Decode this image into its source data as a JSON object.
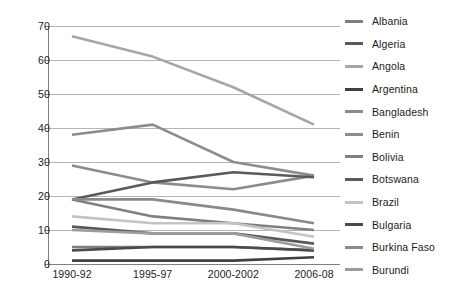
{
  "chart_data": {
    "type": "line",
    "title": "",
    "xlabel": "",
    "ylabel": "",
    "categories": [
      "1990-92",
      "1995-97",
      "2000-2002",
      "2006-08"
    ],
    "ylim": [
      0,
      70
    ],
    "yticks": [
      0,
      10,
      20,
      30,
      40,
      50,
      60,
      70
    ],
    "grid": true,
    "legend_position": "right",
    "series": [
      {
        "name": "Albania",
        "values": [
          5,
          5,
          5,
          4
        ],
        "color": "#7f7f7f"
      },
      {
        "name": "Algeria",
        "values": [
          11,
          9,
          9,
          6
        ],
        "color": "#595959"
      },
      {
        "name": "Angola",
        "values": [
          67,
          61,
          52,
          41
        ],
        "color": "#a6a6a6"
      },
      {
        "name": "Argentina",
        "values": [
          1,
          1,
          1,
          2
        ],
        "color": "#404040"
      },
      {
        "name": "Bangladesh",
        "values": [
          38,
          41,
          30,
          26
        ],
        "color": "#8c8c8c"
      },
      {
        "name": "Benin",
        "values": [
          29,
          24,
          22,
          26
        ],
        "color": "#8c8c8c"
      },
      {
        "name": "Bolivia",
        "values": [
          19,
          14,
          12,
          10
        ],
        "color": "#808080"
      },
      {
        "name": "Botswana",
        "values": [
          19,
          24,
          27,
          25.5
        ],
        "color": "#5a5a5a"
      },
      {
        "name": "Brazil",
        "values": [
          14,
          12,
          12,
          8
        ],
        "color": "#c4c4c4"
      },
      {
        "name": "Bulgaria",
        "values": [
          4,
          5,
          5,
          4
        ],
        "color": "#4a4a4a"
      },
      {
        "name": "Burkina Faso",
        "values": [
          19,
          19,
          16,
          12
        ],
        "color": "#8a8a8a"
      },
      {
        "name": "Burundi",
        "values": [
          10,
          9,
          9,
          4.5
        ],
        "color": "#9c9c9c"
      }
    ]
  },
  "axes": {
    "y_tick_labels": [
      "70",
      "60",
      "50",
      "40",
      "30",
      "20",
      "10",
      "0"
    ],
    "x_tick_labels": [
      "1990-92",
      "1995-97",
      "2000-2002",
      "2006-08"
    ],
    "axis_line_color": "#808080",
    "grid_color": "#b5b5b5"
  },
  "legend": {
    "items": [
      {
        "label": "Albania"
      },
      {
        "label": "Algeria"
      },
      {
        "label": "Angola"
      },
      {
        "label": "Argentina"
      },
      {
        "label": "Bangladesh"
      },
      {
        "label": "Benin"
      },
      {
        "label": "Bolivia"
      },
      {
        "label": "Botswana"
      },
      {
        "label": "Brazil"
      },
      {
        "label": "Bulgaria"
      },
      {
        "label": "Burkina Faso"
      },
      {
        "label": "Burundi"
      }
    ]
  }
}
